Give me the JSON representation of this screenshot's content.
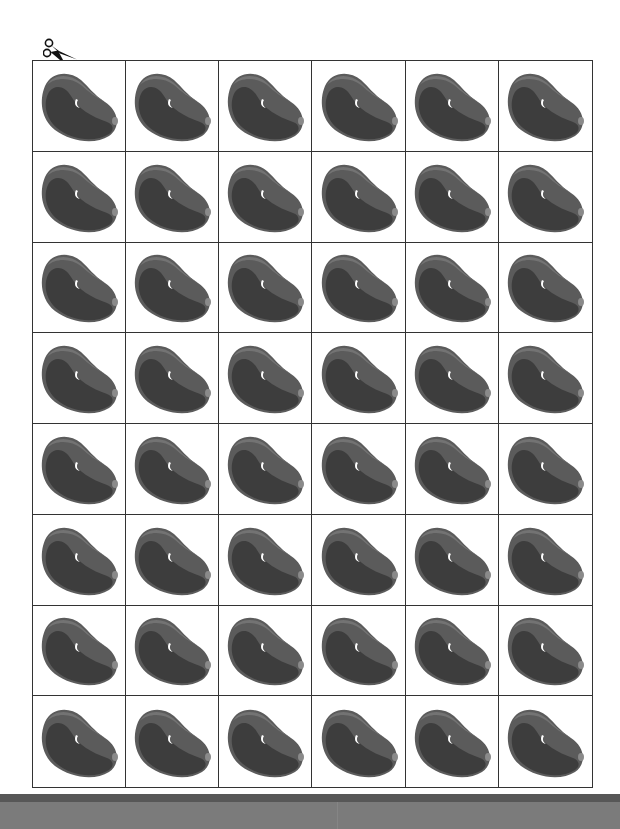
{
  "page": {
    "type": "printable cut-out sheet",
    "cut_icon": "scissors-icon"
  },
  "grid": {
    "columns": 6,
    "rows": 8,
    "item_icon": "bean-icon",
    "item_label": "kidney bean",
    "total_items": 48
  },
  "colors": {
    "bean_outer": "#5b5b5b",
    "bean_inner": "#3d3d3d",
    "bean_rim": "#707070",
    "highlight": "#ffffff",
    "grid_line": "#333333",
    "footer_strip": "#575757",
    "footer_band": "#7b7b7b"
  }
}
